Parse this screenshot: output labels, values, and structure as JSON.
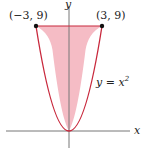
{
  "figure": {
    "axes": {
      "x_label": "x",
      "y_label": "y"
    },
    "curve": {
      "equation_lhs": "y = x",
      "equation_exp": "2"
    },
    "points": [
      {
        "label": "(−3, 9)",
        "x": -3,
        "y": 9
      },
      {
        "label": "(3, 9)",
        "x": 3,
        "y": 9
      }
    ],
    "region": {
      "description": "area between y = x^2 and y = 9",
      "fill": "#f2b8c0",
      "stroke": "#c8283c"
    },
    "colors": {
      "axis": "#777777",
      "curve": "#c8283c",
      "fill": "#f5bcc5",
      "point": "#111111"
    }
  }
}
